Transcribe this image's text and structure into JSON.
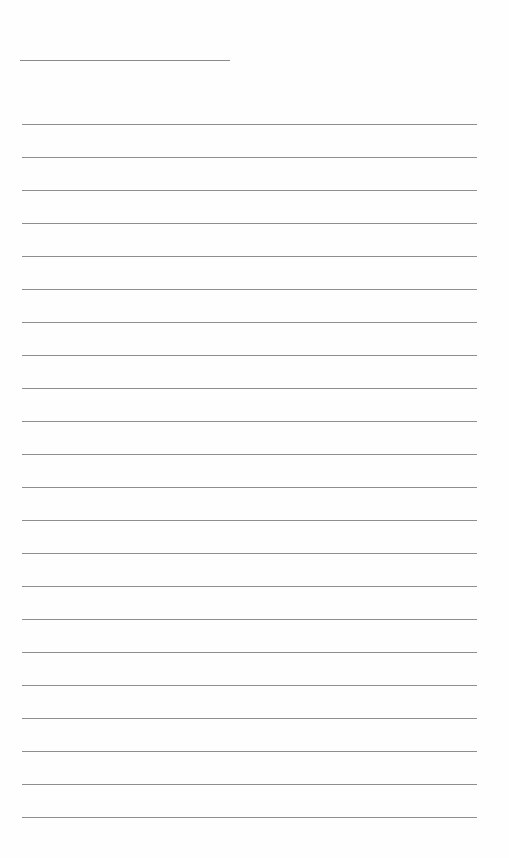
{
  "page": {
    "type": "blank lined sheet",
    "background": "#fefefe",
    "line_color": "#8e8e8e",
    "title_line": {
      "x": 20,
      "y": 60,
      "width": 210
    },
    "rules": {
      "x": 22,
      "width": 455,
      "start_y": 124,
      "spacing": 33,
      "count": 22
    }
  }
}
